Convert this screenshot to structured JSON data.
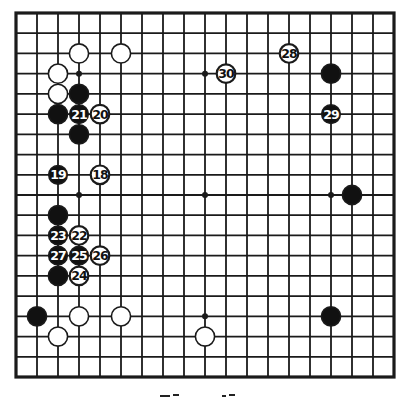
{
  "diagram": {
    "type": "go-board-diagram",
    "board_size": 19,
    "colors": {
      "background": "#ffffff",
      "line": "#1a1a1a",
      "black_stone": "#111111",
      "white_stone": "#ffffff",
      "stone_outline": "#1a1a1a",
      "black_label": "#ffffff",
      "white_label": "#111111"
    },
    "star_points": [
      [
        3,
        3
      ],
      [
        9,
        3
      ],
      [
        15,
        3
      ],
      [
        3,
        9
      ],
      [
        9,
        9
      ],
      [
        15,
        9
      ],
      [
        3,
        15
      ],
      [
        9,
        15
      ],
      [
        15,
        15
      ]
    ],
    "stones": [
      {
        "col": 3,
        "row": 2,
        "color": "white",
        "label": ""
      },
      {
        "col": 5,
        "row": 2,
        "color": "white",
        "label": ""
      },
      {
        "col": 2,
        "row": 3,
        "color": "white",
        "label": ""
      },
      {
        "col": 2,
        "row": 4,
        "color": "white",
        "label": ""
      },
      {
        "col": 3,
        "row": 4,
        "color": "black",
        "label": ""
      },
      {
        "col": 2,
        "row": 5,
        "color": "black",
        "label": ""
      },
      {
        "col": 3,
        "row": 5,
        "color": "black",
        "label": "21"
      },
      {
        "col": 4,
        "row": 5,
        "color": "white",
        "label": "20"
      },
      {
        "col": 3,
        "row": 6,
        "color": "black",
        "label": ""
      },
      {
        "col": 2,
        "row": 8,
        "color": "black",
        "label": "19"
      },
      {
        "col": 4,
        "row": 8,
        "color": "white",
        "label": "18"
      },
      {
        "col": 2,
        "row": 10,
        "color": "black",
        "label": ""
      },
      {
        "col": 2,
        "row": 11,
        "color": "black",
        "label": "23"
      },
      {
        "col": 3,
        "row": 11,
        "color": "white",
        "label": "22"
      },
      {
        "col": 2,
        "row": 12,
        "color": "black",
        "label": "27"
      },
      {
        "col": 3,
        "row": 12,
        "color": "black",
        "label": "25"
      },
      {
        "col": 4,
        "row": 12,
        "color": "white",
        "label": "26"
      },
      {
        "col": 2,
        "row": 13,
        "color": "black",
        "label": ""
      },
      {
        "col": 3,
        "row": 13,
        "color": "white",
        "label": "24"
      },
      {
        "col": 1,
        "row": 15,
        "color": "black",
        "label": ""
      },
      {
        "col": 3,
        "row": 15,
        "color": "white",
        "label": ""
      },
      {
        "col": 5,
        "row": 15,
        "color": "white",
        "label": ""
      },
      {
        "col": 2,
        "row": 16,
        "color": "white",
        "label": ""
      },
      {
        "col": 9,
        "row": 16,
        "color": "white",
        "label": ""
      },
      {
        "col": 15,
        "row": 15,
        "color": "black",
        "label": ""
      },
      {
        "col": 13,
        "row": 2,
        "color": "white",
        "label": "28"
      },
      {
        "col": 10,
        "row": 3,
        "color": "white",
        "label": "30"
      },
      {
        "col": 15,
        "row": 3,
        "color": "black",
        "label": ""
      },
      {
        "col": 15,
        "row": 5,
        "color": "black",
        "label": "29"
      },
      {
        "col": 16,
        "row": 9,
        "color": "black",
        "label": ""
      }
    ],
    "move_range": "18-30",
    "caption": ""
  }
}
